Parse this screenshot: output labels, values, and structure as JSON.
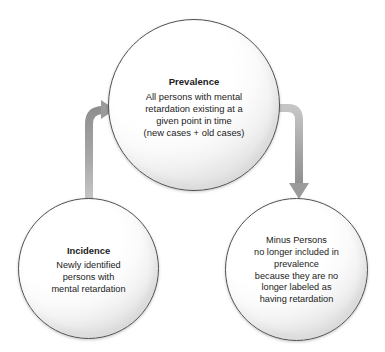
{
  "diagram": {
    "type": "flow-diagram",
    "canvas": {
      "width": 385,
      "height": 352
    },
    "background_color": "#ffffff",
    "text_color": "#1b1b1b",
    "node_outline_color": "#4f4f4f",
    "arrow_color": "#9a9a9a",
    "nodes": [
      {
        "id": "prevalence",
        "title": "Prevalence",
        "lines": [
          "All persons with mental",
          "retardation existing at a",
          "given point in time",
          "(new cases + old cases)"
        ]
      },
      {
        "id": "incidence",
        "title": "Incidence",
        "lines": [
          "Newly identified",
          "persons with",
          "mental retardation"
        ]
      },
      {
        "id": "minus-persons",
        "title": "",
        "lines": [
          "Minus Persons",
          "no longer included in",
          "prevalence",
          "because they are no",
          "longer labeled as",
          "having retardation"
        ]
      }
    ],
    "arrows": [
      {
        "id": "incidence-to-prevalence",
        "from": "incidence",
        "to": "prevalence",
        "direction": "up-right"
      },
      {
        "id": "prevalence-to-minus-persons",
        "from": "prevalence",
        "to": "minus-persons",
        "direction": "right-down"
      }
    ]
  }
}
